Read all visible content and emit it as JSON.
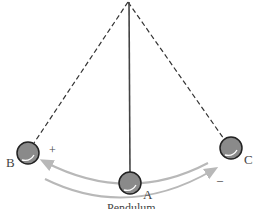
{
  "diagram": {
    "caption": "Pendulum",
    "labels": {
      "left": "B",
      "center": "A",
      "right": "C"
    },
    "signs": {
      "left": "+",
      "right": "–"
    },
    "colors": {
      "line": "#333333",
      "ball": "#8a8a8a",
      "ball_stroke": "#222222",
      "arrow": "#b8b8b8"
    }
  }
}
